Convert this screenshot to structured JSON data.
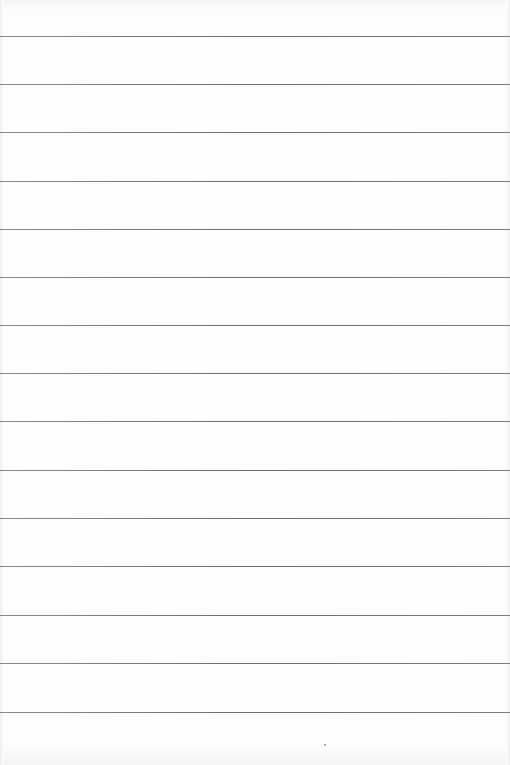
{
  "page": {
    "type": "blank ruled sheet",
    "background_color": "#fdfdfd",
    "rule_color": "#757575",
    "rule_count": 15,
    "rules_y": [
      36,
      84,
      132,
      181,
      229,
      277,
      325,
      373,
      421,
      470,
      518,
      566,
      615,
      663,
      712
    ],
    "text_content": ""
  }
}
